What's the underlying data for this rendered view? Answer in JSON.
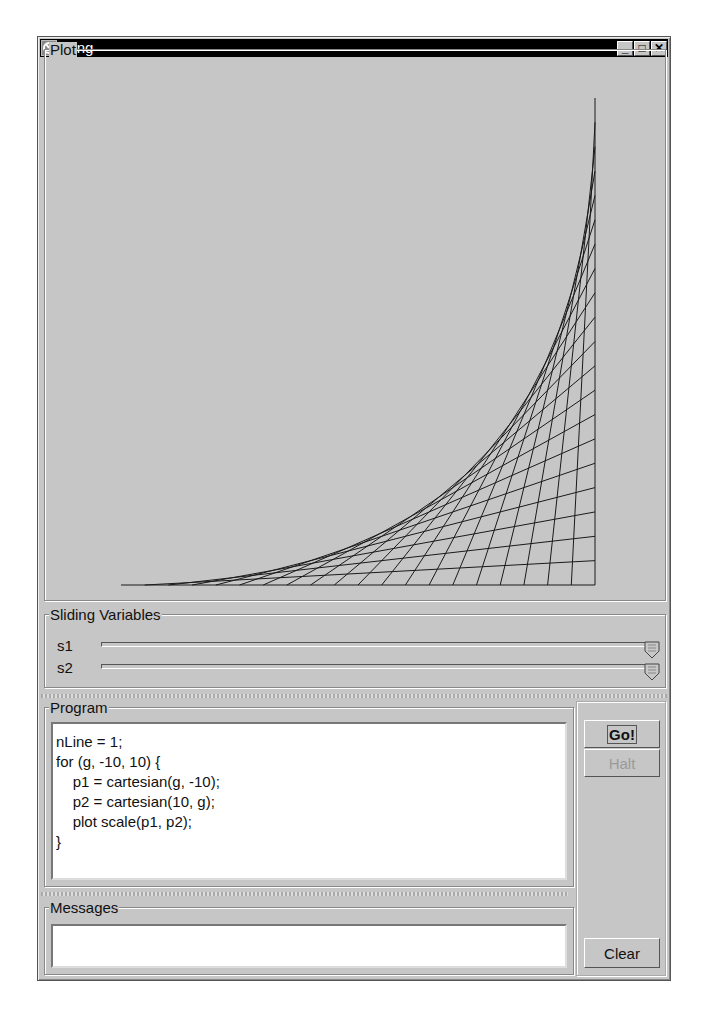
{
  "window": {
    "title": "Sling",
    "controls": [
      "minimize",
      "maximize",
      "close"
    ],
    "minimize_glyph": "_",
    "maximize_glyph": "□",
    "close_glyph": "✕"
  },
  "plot": {
    "title": "Plot",
    "line_color": "#1a1a1a",
    "domain": {
      "xmin": -10,
      "xmax": 10,
      "ymin": -10,
      "ymax": 10
    },
    "g_range": {
      "from": -10,
      "to": 10,
      "step": 1
    }
  },
  "sliders": {
    "title": "Sliding Variables",
    "items": [
      {
        "label": "s1",
        "value_pct": 100
      },
      {
        "label": "s2",
        "value_pct": 100
      }
    ]
  },
  "program": {
    "title": "Program",
    "code": "nLine = 1;\nfor (g, -10, 10) {\n    p1 = cartesian(g, -10);\n    p2 = cartesian(10, g);\n    plot scale(p1, p2);\n}"
  },
  "buttons": {
    "go": "Go!",
    "halt": "Halt",
    "clear": "Clear"
  },
  "messages": {
    "title": "Messages",
    "text": ""
  }
}
